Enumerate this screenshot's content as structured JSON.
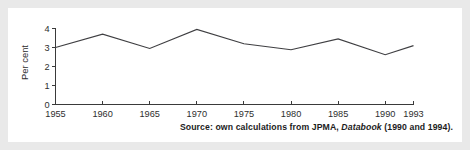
{
  "figure": {
    "background_color": "#e9e9e9",
    "panel_color": "#ffffff",
    "line_color": "#3f3f42",
    "axis_color": "#3a3a3a"
  },
  "source": {
    "prefix": "Source: own calculations from JPMA,",
    "italic_title": "Databook",
    "suffix": "(1990 and 1994)."
  },
  "chart_data": {
    "type": "line",
    "title": "",
    "xlabel": "Year",
    "ylabel": "Per cent",
    "x": [
      1955,
      1960,
      1965,
      1970,
      1975,
      1980,
      1985,
      1990,
      1993
    ],
    "categories": [
      "1955",
      "1960",
      "1965",
      "1970",
      "1975",
      "1980",
      "1985",
      "1990",
      "1993"
    ],
    "values": [
      3.0,
      3.7,
      2.95,
      3.95,
      3.2,
      2.88,
      3.45,
      2.62,
      3.1
    ],
    "series": [
      {
        "name": "Per cent",
        "values": [
          3.0,
          3.7,
          2.95,
          3.95,
          3.2,
          2.88,
          3.45,
          2.62,
          3.1
        ]
      }
    ],
    "xlim": [
      1955,
      1993
    ],
    "ylim": [
      0,
      4
    ],
    "yticks": [
      0,
      1,
      2,
      3,
      4
    ],
    "ytick_labels": [
      "0",
      "1",
      "2",
      "3",
      "4"
    ],
    "xticks": [
      1955,
      1960,
      1965,
      1970,
      1975,
      1980,
      1985,
      1990,
      1993
    ],
    "xtick_labels": [
      "1955",
      "1960",
      "1965",
      "1970",
      "1975",
      "1980",
      "1985",
      "1990",
      "1993"
    ],
    "grid": false,
    "legend": false,
    "legend_position": "none"
  }
}
